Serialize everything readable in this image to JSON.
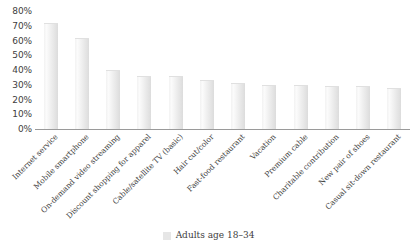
{
  "chart_data": {
    "type": "bar",
    "title": "",
    "xlabel": "",
    "ylabel": "",
    "ylim": [
      0,
      80
    ],
    "ytick_labels": [
      "80%",
      "70%",
      "60%",
      "50%",
      "40%",
      "30%",
      "20%",
      "10%",
      "0%"
    ],
    "ytick_values": [
      80,
      70,
      60,
      50,
      40,
      30,
      20,
      10,
      0
    ],
    "grid": false,
    "legend_position": "bottom",
    "categories": [
      "Internet service",
      "Mobile smartphone",
      "On-demand video streaming",
      "Discount shopping for apparel",
      "Cable/satellite TV (basic)",
      "Hair cut/color",
      "Fast-food restaurant",
      "Vacation",
      "Premium cable",
      "Charitable contribution",
      "New pair of shoes",
      "Casual sit-down restaurant"
    ],
    "series": [
      {
        "name": "Adults age 18–34",
        "color": "#e6e6e6",
        "values": [
          72,
          62,
          40,
          36,
          36,
          33,
          31,
          30,
          30,
          29,
          29,
          28
        ]
      }
    ]
  },
  "legend": {
    "entries": [
      {
        "label": "Adults age 18–34",
        "swatch": "#e6e6e6"
      }
    ]
  }
}
